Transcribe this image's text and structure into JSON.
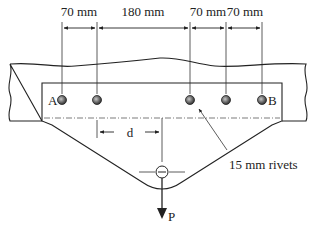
{
  "diagram": {
    "dimensions": [
      {
        "label": "70 mm",
        "x1": 62,
        "x2": 97
      },
      {
        "label": "180 mm",
        "x1": 97,
        "x2": 190
      },
      {
        "label": "70 mm",
        "x1": 190,
        "x2": 226
      },
      {
        "label": "70 mm",
        "x1": 226,
        "x2": 262
      }
    ],
    "rivets": [
      {
        "label": "A",
        "x": 62
      },
      {
        "label": "",
        "x": 97
      },
      {
        "label": "",
        "x": 190
      },
      {
        "label": "",
        "x": 226
      },
      {
        "label": "B",
        "x": 262
      }
    ],
    "rivet_label_a": "A",
    "rivet_label_b": "B",
    "rivet_callout": "15 mm rivets",
    "eccentricity_label": "d",
    "load_label": "P",
    "colors": {
      "line": "#222222",
      "rivet_fill": "#5a5a5a",
      "rivet_highlight": "#bdbdbd",
      "background": "#ffffff"
    }
  }
}
